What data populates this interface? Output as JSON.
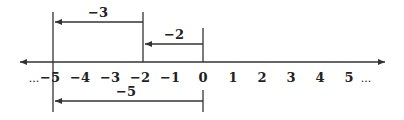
{
  "number_line": {
    "ticks": [
      {
        "label": "−5",
        "value": -5
      },
      {
        "label": "−4",
        "value": -4
      },
      {
        "label": "−3",
        "value": -3
      },
      {
        "label": "−2",
        "value": -2
      },
      {
        "label": "−1",
        "value": -1
      },
      {
        "label": "0",
        "value": 0
      },
      {
        "label": "1",
        "value": 1
      },
      {
        "label": "2",
        "value": 2
      },
      {
        "label": "3",
        "value": 3
      },
      {
        "label": "4",
        "value": 4
      },
      {
        "label": "5",
        "value": 5
      }
    ],
    "left_ellipsis": "...",
    "right_ellipsis": "..."
  },
  "brackets": {
    "top_span": {
      "label": "−3",
      "from": -2,
      "to": -5
    },
    "middle_span": {
      "label": "−2",
      "from": 0,
      "to": -2
    },
    "bottom_span": {
      "label": "−5",
      "from": 0,
      "to": -5
    }
  },
  "colors": {
    "line": "#333333",
    "text": "#222222",
    "background": "#ffffff"
  }
}
